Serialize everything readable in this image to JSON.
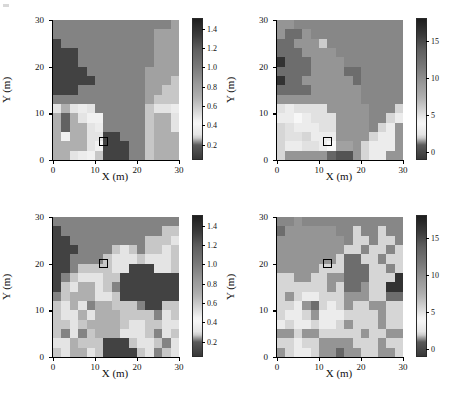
{
  "figure": {
    "axis_label_x": "X (m)",
    "axis_label_y": "Y (m)",
    "x_ticks": [
      "0",
      "10",
      "20",
      "30"
    ],
    "y_ticks": [
      "0",
      "10",
      "20",
      "30"
    ],
    "x_tick_values": [
      0,
      10,
      20,
      30
    ],
    "y_tick_values": [
      0,
      10,
      20,
      30
    ],
    "marker_name": "sample-location-square"
  },
  "chart_data": [
    {
      "panel": "top-left",
      "type": "heatmap",
      "title": "",
      "xlabel": "X (m)",
      "ylabel": "Y (m)",
      "xlim": [
        0,
        30
      ],
      "ylim": [
        0,
        30
      ],
      "grid": false,
      "cell_size_m": 2,
      "colorbar": {
        "ticks": [
          0.2,
          0.4,
          0.6,
          0.8,
          1.0,
          1.2,
          1.4
        ],
        "tick_labels": [
          "0.2",
          "0.4",
          "0.6",
          "0.8",
          "1.0",
          "1.2",
          "1.4"
        ],
        "vmin": 0.05,
        "vmax": 1.5,
        "position": "right"
      },
      "marker": {
        "x": 11,
        "y": 3,
        "w": 2,
        "h": 2
      },
      "values": [
        [
          0.95,
          0.95,
          0.95,
          0.95,
          0.95,
          0.95,
          0.95,
          0.95,
          0.95,
          0.95,
          0.95,
          0.95,
          0.95,
          0.95,
          0.78
        ],
        [
          0.95,
          0.95,
          0.95,
          0.95,
          0.95,
          0.95,
          0.95,
          0.95,
          0.95,
          0.95,
          0.95,
          0.95,
          0.78,
          0.78,
          0.78
        ],
        [
          1.3,
          0.95,
          0.95,
          0.95,
          0.95,
          0.95,
          0.95,
          0.95,
          0.95,
          0.95,
          0.95,
          0.95,
          0.78,
          0.78,
          0.78
        ],
        [
          1.3,
          1.3,
          1.3,
          0.95,
          0.95,
          0.95,
          0.95,
          0.95,
          0.95,
          0.95,
          0.95,
          0.95,
          0.78,
          0.78,
          0.78
        ],
        [
          1.3,
          1.3,
          1.3,
          0.95,
          0.95,
          0.95,
          0.95,
          0.95,
          0.95,
          0.95,
          0.95,
          0.95,
          0.78,
          0.78,
          0.78
        ],
        [
          1.3,
          1.3,
          1.3,
          1.3,
          0.95,
          0.95,
          0.95,
          0.95,
          0.95,
          0.95,
          0.95,
          0.78,
          0.78,
          0.78,
          0.78
        ],
        [
          1.3,
          1.3,
          1.3,
          1.3,
          1.3,
          0.95,
          0.95,
          0.95,
          0.95,
          0.95,
          0.95,
          0.78,
          0.78,
          0.78,
          0.6
        ],
        [
          1.3,
          1.3,
          1.3,
          0.95,
          0.95,
          0.95,
          0.95,
          0.95,
          0.95,
          0.95,
          0.95,
          0.78,
          0.78,
          0.6,
          0.6
        ],
        [
          0.95,
          0.95,
          0.95,
          0.95,
          0.95,
          0.95,
          0.95,
          0.95,
          0.95,
          0.95,
          0.95,
          0.78,
          0.6,
          0.6,
          0.6
        ],
        [
          0.3,
          0.25,
          0.3,
          0.35,
          0.3,
          0.95,
          0.95,
          0.95,
          0.95,
          0.95,
          0.95,
          0.6,
          0.3,
          0.3,
          0.35
        ],
        [
          0.25,
          0.2,
          0.25,
          0.3,
          0.45,
          0.45,
          0.95,
          0.95,
          0.95,
          0.95,
          0.95,
          0.6,
          0.25,
          0.25,
          0.3
        ],
        [
          0.25,
          0.2,
          0.25,
          0.25,
          0.3,
          0.35,
          0.95,
          0.95,
          0.95,
          0.95,
          0.95,
          0.6,
          0.25,
          0.25,
          0.3
        ],
        [
          0.25,
          0.45,
          0.25,
          0.25,
          0.3,
          0.3,
          1.3,
          1.3,
          0.95,
          0.95,
          0.95,
          0.6,
          0.25,
          0.25,
          0.25
        ],
        [
          0.25,
          0.25,
          0.25,
          0.25,
          0.3,
          0.45,
          1.3,
          1.3,
          1.3,
          0.95,
          0.95,
          0.6,
          0.25,
          0.25,
          0.25
        ],
        [
          0.25,
          0.25,
          0.3,
          0.35,
          0.45,
          0.6,
          1.3,
          1.3,
          1.3,
          0.95,
          0.95,
          0.6,
          0.25,
          0.25,
          0.25
        ]
      ]
    },
    {
      "panel": "top-right",
      "type": "heatmap",
      "title": "",
      "xlabel": "X (m)",
      "ylabel": "Y (m)",
      "xlim": [
        0,
        30
      ],
      "ylim": [
        0,
        30
      ],
      "grid": false,
      "cell_size_m": 2,
      "colorbar": {
        "ticks": [
          0,
          5,
          10,
          15
        ],
        "tick_labels": [
          "0",
          "5",
          "10",
          "15"
        ],
        "vmin": -1,
        "vmax": 18,
        "position": "right"
      },
      "marker": {
        "x": 11,
        "y": 3,
        "w": 2,
        "h": 2
      },
      "values": [
        [
          9.5,
          9.5,
          10.5,
          10.5,
          10.5,
          10.5,
          10.5,
          10.5,
          10.5,
          10.5,
          10.5,
          10.5,
          10.5,
          10.5,
          10.5
        ],
        [
          9.5,
          12.5,
          12.5,
          9.5,
          10.5,
          10.5,
          10.5,
          10.5,
          10.5,
          10.5,
          10.5,
          10.5,
          10.5,
          10.5,
          10.5
        ],
        [
          12.5,
          12.5,
          9.5,
          9.5,
          9.5,
          6.0,
          10.5,
          10.5,
          10.5,
          10.5,
          10.5,
          10.5,
          10.5,
          10.5,
          10.5
        ],
        [
          12.5,
          12.5,
          12.5,
          9.5,
          9.5,
          9.5,
          9.5,
          10.5,
          10.5,
          10.5,
          10.5,
          10.5,
          10.5,
          10.5,
          10.5
        ],
        [
          16.5,
          12.5,
          12.5,
          12.5,
          9.5,
          9.5,
          9.5,
          9.5,
          10.5,
          10.5,
          10.5,
          10.5,
          10.5,
          10.5,
          10.5
        ],
        [
          12.5,
          12.5,
          12.5,
          12.5,
          9.5,
          9.5,
          9.5,
          9.5,
          12.5,
          12.5,
          10.5,
          10.5,
          10.5,
          10.5,
          10.5
        ],
        [
          16.5,
          12.5,
          12.5,
          9.5,
          9.5,
          9.5,
          9.5,
          9.5,
          9.5,
          12.5,
          10.5,
          10.5,
          10.5,
          10.5,
          10.5
        ],
        [
          12.5,
          12.5,
          12.5,
          12.5,
          9.5,
          9.5,
          9.5,
          9.5,
          9.5,
          9.5,
          10.5,
          10.5,
          10.5,
          10.5,
          10.5
        ],
        [
          9.5,
          9.5,
          9.5,
          9.5,
          9.5,
          9.5,
          9.5,
          9.5,
          9.5,
          9.5,
          10.5,
          10.5,
          10.5,
          10.5,
          10.5
        ],
        [
          5.0,
          4.5,
          5.0,
          5.0,
          5.0,
          5.0,
          9.5,
          9.5,
          9.5,
          9.5,
          9.5,
          10.5,
          10.5,
          10.5,
          5.5
        ],
        [
          4.5,
          4.5,
          4.0,
          4.5,
          5.0,
          5.0,
          5.0,
          9.5,
          9.5,
          9.5,
          9.5,
          10.5,
          10.5,
          5.5,
          4.5
        ],
        [
          5.5,
          5.0,
          4.5,
          4.5,
          4.5,
          5.0,
          5.0,
          9.5,
          9.5,
          9.5,
          9.5,
          10.5,
          5.5,
          4.5,
          9.5
        ],
        [
          5.5,
          5.0,
          5.0,
          5.5,
          4.5,
          4.5,
          4.5,
          9.5,
          9.5,
          9.5,
          9.5,
          5.5,
          4.5,
          4.5,
          9.5
        ],
        [
          5.5,
          4.5,
          4.5,
          5.0,
          5.0,
          4.5,
          4.0,
          1.5,
          1.5,
          9.5,
          5.5,
          4.5,
          4.5,
          4.5,
          9.5
        ],
        [
          5.5,
          9.5,
          9.5,
          9.5,
          9.5,
          9.5,
          1.0,
          0.5,
          0.5,
          9.5,
          5.5,
          4.5,
          4.5,
          9.5,
          9.5
        ]
      ]
    },
    {
      "panel": "bottom-left",
      "type": "heatmap",
      "title": "",
      "xlabel": "X (m)",
      "ylabel": "Y (m)",
      "xlim": [
        0,
        30
      ],
      "ylim": [
        0,
        30
      ],
      "grid": false,
      "cell_size_m": 2,
      "colorbar": {
        "ticks": [
          0.2,
          0.4,
          0.6,
          0.8,
          1.0,
          1.2,
          1.4
        ],
        "tick_labels": [
          "0.2",
          "0.4",
          "0.6",
          "0.8",
          "1.0",
          "1.2",
          "1.4"
        ],
        "vmin": 0.05,
        "vmax": 1.5,
        "position": "right"
      },
      "marker": {
        "x": 11,
        "y": 19,
        "w": 2,
        "h": 2
      },
      "values": [
        [
          0.95,
          0.95,
          0.95,
          0.95,
          0.95,
          0.95,
          0.95,
          0.95,
          0.95,
          0.95,
          0.95,
          0.95,
          0.95,
          0.95,
          0.95
        ],
        [
          1.3,
          0.95,
          0.95,
          0.95,
          0.95,
          0.95,
          0.95,
          0.95,
          0.95,
          0.95,
          0.95,
          0.95,
          0.95,
          0.6,
          0.6
        ],
        [
          1.3,
          1.3,
          0.95,
          0.95,
          0.95,
          0.95,
          0.95,
          0.95,
          0.95,
          0.95,
          0.95,
          0.6,
          0.6,
          0.6,
          0.3
        ],
        [
          1.3,
          1.3,
          1.3,
          0.95,
          0.95,
          0.95,
          0.95,
          0.6,
          0.3,
          0.6,
          0.95,
          0.6,
          0.6,
          0.3,
          0.6
        ],
        [
          1.3,
          1.3,
          0.95,
          0.95,
          0.95,
          0.95,
          0.6,
          0.3,
          0.3,
          0.3,
          0.6,
          0.3,
          0.3,
          0.3,
          0.6
        ],
        [
          1.3,
          1.3,
          0.95,
          0.6,
          0.6,
          0.6,
          0.6,
          0.3,
          0.3,
          1.3,
          1.3,
          1.3,
          0.3,
          0.3,
          0.6
        ],
        [
          1.3,
          0.95,
          0.6,
          0.3,
          0.3,
          0.3,
          0.6,
          0.6,
          1.3,
          1.3,
          1.3,
          1.3,
          1.3,
          1.3,
          1.3
        ],
        [
          1.3,
          0.6,
          0.3,
          0.25,
          0.25,
          0.3,
          0.6,
          0.95,
          1.3,
          1.3,
          1.3,
          1.3,
          1.3,
          1.3,
          1.3
        ],
        [
          0.95,
          0.6,
          0.25,
          0.25,
          0.25,
          0.3,
          0.3,
          0.6,
          1.3,
          1.3,
          1.3,
          1.3,
          1.3,
          1.3,
          1.3
        ],
        [
          0.6,
          0.3,
          0.25,
          0.3,
          0.95,
          0.25,
          0.25,
          0.6,
          0.6,
          0.6,
          0.95,
          1.3,
          1.3,
          0.6,
          0.6
        ],
        [
          0.6,
          0.3,
          0.3,
          0.25,
          0.3,
          0.25,
          0.25,
          0.25,
          0.6,
          0.6,
          0.6,
          0.6,
          0.95,
          0.3,
          0.6
        ],
        [
          0.6,
          0.6,
          0.3,
          0.6,
          0.25,
          0.25,
          0.25,
          0.25,
          0.6,
          0.3,
          0.3,
          0.6,
          0.6,
          0.3,
          0.3
        ],
        [
          0.6,
          0.95,
          0.3,
          0.95,
          0.6,
          0.25,
          0.25,
          0.25,
          0.3,
          0.3,
          0.3,
          0.6,
          0.95,
          0.3,
          0.6
        ],
        [
          0.3,
          0.3,
          0.25,
          0.6,
          0.6,
          0.6,
          1.3,
          1.3,
          1.3,
          0.6,
          0.3,
          0.3,
          0.6,
          0.95,
          0.3
        ],
        [
          0.6,
          0.3,
          0.25,
          0.25,
          0.3,
          0.6,
          1.3,
          1.3,
          1.3,
          1.3,
          0.6,
          0.3,
          0.95,
          0.6,
          0.3
        ]
      ]
    },
    {
      "panel": "bottom-right",
      "type": "heatmap",
      "title": "",
      "xlabel": "X (m)",
      "ylabel": "Y (m)",
      "xlim": [
        0,
        30
      ],
      "ylim": [
        0,
        30
      ],
      "grid": false,
      "cell_size_m": 2,
      "colorbar": {
        "ticks": [
          0,
          5,
          10,
          15
        ],
        "tick_labels": [
          "0",
          "5",
          "10",
          "15"
        ],
        "vmin": -1,
        "vmax": 18,
        "position": "right"
      },
      "marker": {
        "x": 11,
        "y": 19,
        "w": 2,
        "h": 2
      },
      "values": [
        [
          10.5,
          10.5,
          9.5,
          10.5,
          10.5,
          10.5,
          10.5,
          10.5,
          10.5,
          10.5,
          10.5,
          10.5,
          10.5,
          10.5,
          10.5
        ],
        [
          12.5,
          9.5,
          9.5,
          9.5,
          9.5,
          9.5,
          9.5,
          10.5,
          10.5,
          5.5,
          10.5,
          10.5,
          5.5,
          10.5,
          10.5
        ],
        [
          9.5,
          9.5,
          9.5,
          9.5,
          9.5,
          9.5,
          9.5,
          9.5,
          10.5,
          5.5,
          5.5,
          10.5,
          5.5,
          5.5,
          10.5
        ],
        [
          9.5,
          9.5,
          9.5,
          9.5,
          9.5,
          9.5,
          9.5,
          9.5,
          5.5,
          5.5,
          10.5,
          5.5,
          5.5,
          10.5,
          5.5
        ],
        [
          9.5,
          9.5,
          9.5,
          9.5,
          9.5,
          9.5,
          9.5,
          5.5,
          12.5,
          12.5,
          5.5,
          5.5,
          10.5,
          5.5,
          5.5
        ],
        [
          9.5,
          9.5,
          9.5,
          9.5,
          9.5,
          5.5,
          5.5,
          5.5,
          12.5,
          12.5,
          12.5,
          5.5,
          5.5,
          10.5,
          5.5
        ],
        [
          5.5,
          5.5,
          9.5,
          9.5,
          5.5,
          5.5,
          9.5,
          9.5,
          12.5,
          12.5,
          12.5,
          5.5,
          5.5,
          5.5,
          16.5
        ],
        [
          5.5,
          5.5,
          5.5,
          5.5,
          5.5,
          5.5,
          9.5,
          5.5,
          12.5,
          12.5,
          9.5,
          5.5,
          5.5,
          16.5,
          16.5
        ],
        [
          5.5,
          9.5,
          5.5,
          4.5,
          4.5,
          5.5,
          5.5,
          5.5,
          9.5,
          9.5,
          9.5,
          5.5,
          5.5,
          12.5,
          12.5
        ],
        [
          5.5,
          5.5,
          4.5,
          9.5,
          12.5,
          5.5,
          4.5,
          5.5,
          9.5,
          5.5,
          5.5,
          9.5,
          9.5,
          5.5,
          5.5
        ],
        [
          5.5,
          4.5,
          4.5,
          5.5,
          9.5,
          4.5,
          4.5,
          4.5,
          5.5,
          5.5,
          5.5,
          5.5,
          9.5,
          5.5,
          5.5
        ],
        [
          4.5,
          5.5,
          4.5,
          4.5,
          5.5,
          4.5,
          4.5,
          5.5,
          9.5,
          5.5,
          5.5,
          5.5,
          9.5,
          5.5,
          5.5
        ],
        [
          9.5,
          9.5,
          5.5,
          9.5,
          9.5,
          5.5,
          5.5,
          5.5,
          5.5,
          5.5,
          9.5,
          5.5,
          5.5,
          9.5,
          9.5
        ],
        [
          5.5,
          5.5,
          4.5,
          5.5,
          5.5,
          9.5,
          9.5,
          9.5,
          9.5,
          5.5,
          5.5,
          5.5,
          9.5,
          5.5,
          5.5
        ],
        [
          9.5,
          5.5,
          4.5,
          4.5,
          5.5,
          9.5,
          9.5,
          1.0,
          9.5,
          9.5,
          5.5,
          5.5,
          9.5,
          9.5,
          5.5
        ]
      ]
    }
  ]
}
